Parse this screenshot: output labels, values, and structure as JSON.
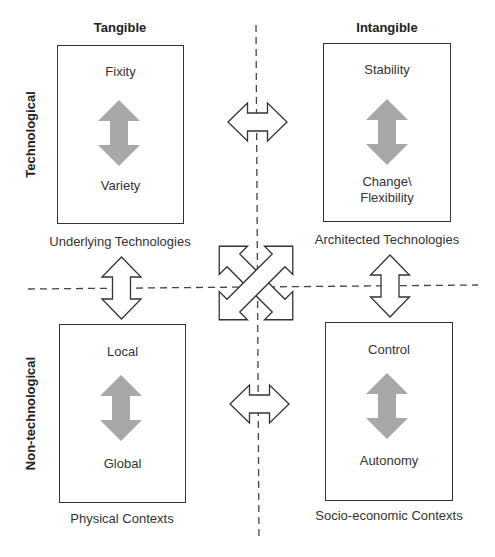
{
  "columns": {
    "left": "Tangible",
    "right": "Intangible"
  },
  "rows": {
    "top": "Technological",
    "bottom": "Non-technological"
  },
  "quadrants": {
    "top_left": {
      "top_pole": "Fixity",
      "bottom_pole": "Variety",
      "caption": "Underlying Technologies"
    },
    "top_right": {
      "top_pole": "Stability",
      "bottom_pole_line1": "Change\\",
      "bottom_pole_line2": "Flexibility",
      "caption": "Architected Technologies"
    },
    "bottom_left": {
      "top_pole": "Local",
      "bottom_pole": "Global",
      "caption": "Physical Contexts"
    },
    "bottom_right": {
      "top_pole": "Control",
      "bottom_pole": "Autonomy",
      "caption": "Socio-economic Contexts"
    }
  },
  "colors": {
    "line": "#333333",
    "tension_arrow": "#a8a8a8",
    "background": "#ffffff"
  }
}
